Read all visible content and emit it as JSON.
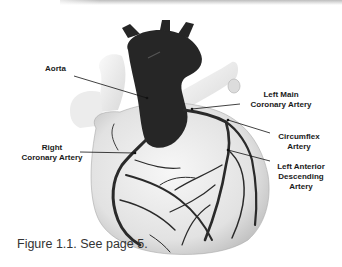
{
  "figure": {
    "caption": "Figure 1.1. See page 5.",
    "labels": {
      "aorta": "Aorta",
      "left_main": [
        "Left Main",
        "Coronary Artery"
      ],
      "circumflex": [
        "Circumflex",
        "Artery"
      ],
      "right_coronary": [
        "Right",
        "Coronary Artery"
      ],
      "lad": [
        "Left Anterior",
        "Descending",
        "Artery"
      ]
    }
  },
  "colors": {
    "artery": "#2a2a2a",
    "heart_fill": "#e8e8e8",
    "label_text": "#1a1a1a",
    "caption_text": "#333333"
  }
}
